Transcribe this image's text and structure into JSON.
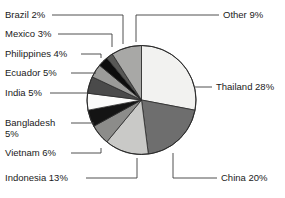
{
  "chart_data": {
    "type": "pie",
    "title": "",
    "categories": [
      "Thailand",
      "China",
      "Indonesia",
      "Vietnam",
      "Bangladesh",
      "India",
      "Ecuador",
      "Philippines",
      "Mexico",
      "Brazil",
      "Other"
    ],
    "values": [
      28,
      20,
      13,
      6,
      5,
      5,
      5,
      4,
      3,
      2,
      9
    ],
    "unit": "%",
    "legend_position": "callout-labels",
    "grid": false,
    "start_angle_deg": 0,
    "direction": "clockwise",
    "slice_colors": [
      "#f2f2f0",
      "#6e6e6e",
      "#c9c9c7",
      "#8c8c8a",
      "#141414",
      "#fbfbfa",
      "#4a4a4a",
      "#9b9b99",
      "#0d0d0d",
      "#585856",
      "#a8a8a6"
    ],
    "slices": [
      {
        "label": "Thailand 28%",
        "name": "Thailand",
        "value": 28,
        "color": "#f2f2f0"
      },
      {
        "label": "China 20%",
        "name": "China",
        "value": 20,
        "color": "#6e6e6e"
      },
      {
        "label": "Indonesia 13%",
        "name": "Indonesia",
        "value": 13,
        "color": "#c9c9c7"
      },
      {
        "label": "Vietnam 6%",
        "name": "Vietnam",
        "value": 6,
        "color": "#8c8c8a"
      },
      {
        "label": "Bangladesh 5%",
        "name": "Bangladesh",
        "value": 5,
        "color": "#141414"
      },
      {
        "label": "India 5%",
        "name": "India",
        "value": 5,
        "color": "#fbfbfa"
      },
      {
        "label": "Ecuador 5%",
        "name": "Ecuador",
        "value": 5,
        "color": "#4a4a4a"
      },
      {
        "label": "Philippines 4%",
        "name": "Philippines",
        "value": 4,
        "color": "#9b9b99"
      },
      {
        "label": "Mexico 3%",
        "name": "Mexico",
        "value": 3,
        "color": "#0d0d0d"
      },
      {
        "label": "Brazil 2%",
        "name": "Brazil",
        "value": 2,
        "color": "#585856"
      },
      {
        "label": "Other 9%",
        "name": "Other",
        "value": 9,
        "color": "#a8a8a6"
      }
    ]
  },
  "labels": {
    "brazil": "Brazil 2%",
    "mexico": "Mexico 3%",
    "philippines": "Philippines 4%",
    "ecuador": "Ecuador 5%",
    "india": "India 5%",
    "bangladesh": "Bangladesh 5%",
    "vietnam": "Vietnam 6%",
    "indonesia": "Indonesia 13%",
    "other": "Other 9%",
    "thailand": "Thailand 28%",
    "china": "China 20%"
  }
}
